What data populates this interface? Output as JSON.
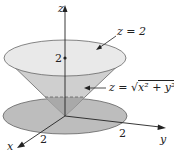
{
  "diagram": {
    "axes": {
      "x": "x",
      "y": "y",
      "z": "z"
    },
    "ticks": {
      "z": "2",
      "x": "2",
      "y": "2"
    },
    "labels": {
      "plane": "z = 2",
      "cone_prefix": "z = ",
      "cone_radicand": "x² + y²"
    },
    "colors": {
      "top_disk": "#e9e9e9",
      "cone": "#cfcfcf",
      "cone_inner": "#a9a9a9",
      "bottom_disk": "#bdbdbd",
      "stroke": "#333333"
    }
  }
}
